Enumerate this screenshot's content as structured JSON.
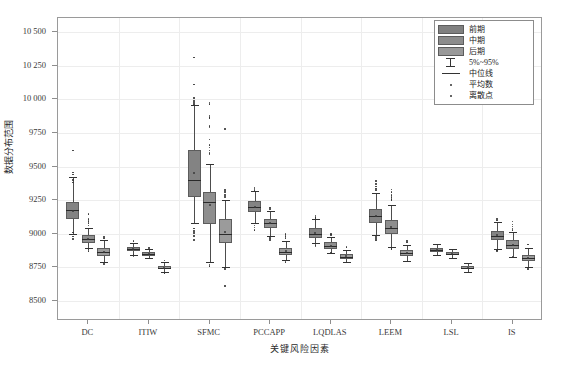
{
  "top_note": "",
  "chart_data": {
    "type": "box",
    "title": "",
    "xlabel": "关键风险因素",
    "ylabel": "数据分布范围",
    "ylim": [
      8500,
      10500
    ],
    "ytick_values": [
      8500,
      8750,
      9000,
      9250,
      9500,
      9750,
      10000,
      10250,
      10500
    ],
    "ytick_labels": [
      "8500",
      "8750",
      "9000",
      "9250",
      "9500",
      "9750",
      "10 000",
      "10 250",
      "10 500"
    ],
    "grid": true,
    "legend_position": "top-right",
    "legend": [
      {
        "key": "swatch",
        "label": "前期",
        "color": "#808080"
      },
      {
        "key": "swatch",
        "label": "中期",
        "color": "#8c8c8c"
      },
      {
        "key": "swatch",
        "label": "后期",
        "color": "#999999"
      },
      {
        "key": "errorbar",
        "label": "5%~95%"
      },
      {
        "key": "line",
        "label": "中位线"
      },
      {
        "key": "dot",
        "label": "平均数"
      },
      {
        "key": "dot",
        "label": "离散点"
      }
    ],
    "categories": [
      "DC",
      "ITIW",
      "SFMC",
      "PCCAPP",
      "LQDLAS",
      "LEEM",
      "LSL",
      "IS"
    ],
    "series": [
      {
        "name": "前期",
        "color": "#838383",
        "boxes": [
          {
            "category": "DC",
            "low": 9000,
            "q1": 9110,
            "median": 9175,
            "q3": 9235,
            "high": 9420,
            "mean": 9170,
            "outliers": [
              9620,
              9455,
              9440,
              9400,
              9380,
              9010,
              8995,
              8980,
              8960
            ]
          },
          {
            "category": "ITIW",
            "low": 8845,
            "q1": 8868,
            "median": 8885,
            "q3": 8900,
            "high": 8930,
            "mean": 8884,
            "outliers": [
              8945,
              8840,
              8832
            ]
          },
          {
            "category": "SFMC",
            "low": 9080,
            "q1": 9275,
            "median": 9400,
            "q3": 9620,
            "high": 9955,
            "mean": 9455,
            "outliers": [
              10310,
              10110,
              10010,
              9985,
              9970,
              9960,
              9040,
              9020,
              9005,
              8985,
              8955
            ]
          },
          {
            "category": "PCCAPP",
            "low": 9080,
            "q1": 9160,
            "median": 9200,
            "q3": 9245,
            "high": 9320,
            "mean": 9200,
            "outliers": [
              9345,
              9335,
              9325,
              9060,
              9045,
              9030
            ]
          },
          {
            "category": "LQDLAS",
            "low": 8930,
            "q1": 8970,
            "median": 9000,
            "q3": 9040,
            "high": 9110,
            "mean": 9002,
            "outliers": [
              9135,
              9125,
              9118,
              8915,
              8905
            ]
          },
          {
            "category": "LEEM",
            "low": 8990,
            "q1": 9080,
            "median": 9135,
            "q3": 9185,
            "high": 9300,
            "mean": 9130,
            "outliers": [
              9390,
              9370,
              9350,
              9335,
              9325,
              8975,
              8960,
              8950
            ]
          },
          {
            "category": "LSL",
            "low": 8845,
            "q1": 8865,
            "median": 8880,
            "q3": 8895,
            "high": 8925,
            "mean": 8880,
            "outliers": []
          },
          {
            "category": "IS",
            "low": 8890,
            "q1": 8955,
            "median": 8985,
            "q3": 9020,
            "high": 9085,
            "mean": 8987,
            "outliers": [
              9110,
              9100,
              8880,
              8870
            ]
          }
        ]
      },
      {
        "name": "中期",
        "color": "#8e8e8e",
        "boxes": [
          {
            "category": "DC",
            "low": 8895,
            "q1": 8930,
            "median": 8958,
            "q3": 8988,
            "high": 9040,
            "mean": 8958,
            "outliers": [
              9145,
              9110,
              9095,
              9080,
              9060,
              8885,
              8870
            ]
          },
          {
            "category": "ITIW",
            "low": 8820,
            "q1": 8838,
            "median": 8850,
            "q3": 8862,
            "high": 8885,
            "mean": 8850,
            "outliers": [
              8895,
              8815
            ]
          },
          {
            "category": "SFMC",
            "low": 8790,
            "q1": 9075,
            "median": 9235,
            "q3": 9310,
            "high": 9520,
            "mean": 9215,
            "outliers": [
              9975,
              9965,
              9880,
              9870,
              9860,
              9800,
              9790,
              9700,
              9660,
              9640,
              9620,
              9600,
              9590,
              8785,
              8770,
              8760
            ]
          },
          {
            "category": "PCCAPP",
            "low": 8985,
            "q1": 9045,
            "median": 9080,
            "q3": 9110,
            "high": 9170,
            "mean": 9080,
            "outliers": [
              9195,
              9185,
              8975,
              8965,
              8955
            ]
          },
          {
            "category": "LQDLAS",
            "low": 8860,
            "q1": 8890,
            "median": 8910,
            "q3": 8935,
            "high": 8975,
            "mean": 8912,
            "outliers": [
              9000,
              8990,
              8855
            ]
          },
          {
            "category": "LEEM",
            "low": 8905,
            "q1": 9000,
            "median": 9045,
            "q3": 9100,
            "high": 9215,
            "mean": 9048,
            "outliers": [
              9330,
              9310,
              9290,
              9275,
              9260,
              9250,
              8895,
              8885
            ]
          },
          {
            "category": "LSL",
            "low": 8820,
            "q1": 8840,
            "median": 8853,
            "q3": 8866,
            "high": 8890,
            "mean": 8853,
            "outliers": []
          },
          {
            "category": "IS",
            "low": 8830,
            "q1": 8890,
            "median": 8918,
            "q3": 8950,
            "high": 9010,
            "mean": 8920,
            "outliers": [
              9090,
              9070,
              9055,
              9040,
              9030,
              8825
            ]
          }
        ]
      },
      {
        "name": "后期",
        "color": "#9b9b9b",
        "boxes": [
          {
            "category": "DC",
            "low": 8790,
            "q1": 8838,
            "median": 8865,
            "q3": 8895,
            "high": 8950,
            "mean": 8866,
            "outliers": [
              8975,
              8965,
              8785,
              8775
            ]
          },
          {
            "category": "ITIW",
            "low": 8715,
            "q1": 8735,
            "median": 8748,
            "q3": 8762,
            "high": 8790,
            "mean": 8748,
            "outliers": [
              8800,
              8710
            ]
          },
          {
            "category": "SFMC",
            "low": 8755,
            "q1": 8930,
            "median": 9000,
            "q3": 9110,
            "high": 9250,
            "mean": 9010,
            "outliers": [
              9780,
              9325,
              9310,
              9290,
              9275,
              8610,
              8750,
              8740
            ]
          },
          {
            "category": "PCCAPP",
            "low": 8805,
            "q1": 8845,
            "median": 8868,
            "q3": 8895,
            "high": 8945,
            "mean": 8869,
            "outliers": [
              9000,
              8985,
              8970,
              8800,
              8790
            ]
          },
          {
            "category": "LQDLAS",
            "low": 8790,
            "q1": 8815,
            "median": 8830,
            "q3": 8848,
            "high": 8880,
            "mean": 8831,
            "outliers": [
              8900,
              8785
            ]
          },
          {
            "category": "LEEM",
            "low": 8800,
            "q1": 8835,
            "median": 8855,
            "q3": 8878,
            "high": 8920,
            "mean": 8856,
            "outliers": [
              8945,
              8935,
              8795
            ]
          },
          {
            "category": "LSL",
            "low": 8715,
            "q1": 8735,
            "median": 8746,
            "q3": 8758,
            "high": 8785,
            "mean": 8746,
            "outliers": []
          },
          {
            "category": "IS",
            "low": 8755,
            "q1": 8795,
            "median": 8818,
            "q3": 8845,
            "high": 8895,
            "mean": 8819,
            "outliers": [
              8920,
              8750,
              8740
            ]
          }
        ]
      }
    ]
  }
}
